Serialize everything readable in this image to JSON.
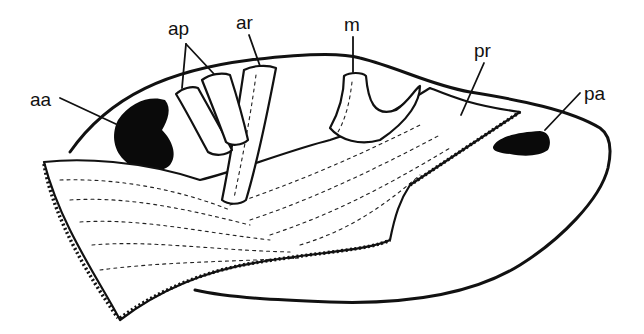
{
  "figure": {
    "labels": [
      {
        "id": "aa",
        "text": "aa",
        "x": 30,
        "y": 106
      },
      {
        "id": "ap",
        "text": "ap",
        "x": 168,
        "y": 35
      },
      {
        "id": "ar",
        "text": "ar",
        "x": 236,
        "y": 29
      },
      {
        "id": "m",
        "text": "m",
        "x": 344,
        "y": 31
      },
      {
        "id": "pr",
        "text": "pr",
        "x": 474,
        "y": 57
      },
      {
        "id": "pa",
        "text": "pa",
        "x": 584,
        "y": 100
      }
    ],
    "colors": {
      "ink": "#111111",
      "background": "#ffffff"
    }
  }
}
